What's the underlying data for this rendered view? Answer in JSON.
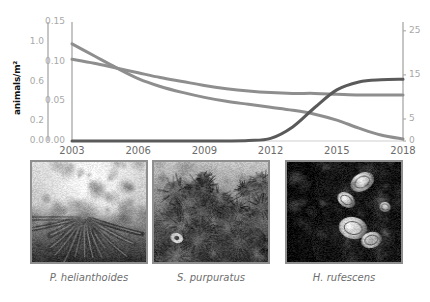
{
  "figure": {
    "background": "#ffffff",
    "panel_a_name": "population-trend-chart",
    "panel_b_name": "species-photo-row"
  },
  "chart_data": {
    "type": "line",
    "title": "",
    "xlabel": "",
    "ylabel": "animals/m²",
    "grid": false,
    "legend": "none",
    "x": [
      2003,
      2004,
      2005,
      2006,
      2007,
      2008,
      2009,
      2010,
      2011,
      2012,
      2013,
      2014,
      2015,
      2016,
      2017,
      2018
    ],
    "xlim": [
      2003,
      2018
    ],
    "xticks": [
      "2003",
      "2006",
      "2009",
      "2012",
      "2015",
      "2018"
    ],
    "axes": [
      {
        "id": "axis-left-outer",
        "position": "left-outer",
        "color": "#a8a8a8",
        "ticks": [
          "1.0",
          "0.6",
          "0.2",
          "0.0"
        ],
        "tick_values": [
          1.0,
          0.6,
          0.2,
          0.0
        ],
        "lim": [
          0.0,
          1.2
        ],
        "belongs_to": "H. rufescens"
      },
      {
        "id": "axis-left-inner",
        "position": "left-inner",
        "color": "#a8a8a8",
        "ticks": [
          "0.15",
          "0.10",
          "0.05",
          "0.00"
        ],
        "tick_values": [
          0.15,
          0.1,
          0.05,
          0.0
        ],
        "lim": [
          0.0,
          0.15
        ],
        "belongs_to": "P. helianthoides"
      },
      {
        "id": "axis-right",
        "position": "right",
        "color": "#a8a8a8",
        "ticks": [
          "25",
          "15",
          "5",
          "0"
        ],
        "tick_values": [
          25,
          15,
          5,
          0
        ],
        "lim": [
          0,
          27
        ],
        "belongs_to": "S. purpuratus"
      }
    ],
    "series": [
      {
        "name": "P. helianthoides",
        "axis": "axis-left-inner",
        "color": "#8e8e8e",
        "width": 3,
        "values": [
          0.103,
          0.098,
          0.092,
          0.086,
          0.08,
          0.075,
          0.07,
          0.066,
          0.063,
          0.061,
          0.06,
          0.06,
          0.059,
          0.058,
          0.058,
          0.058
        ]
      },
      {
        "name": "S. purpuratus",
        "axis": "axis-right",
        "color": "#8e8e8e",
        "width": 3,
        "values": [
          0.0,
          0.0,
          0.0,
          0.0,
          0.0,
          0.0,
          0.0,
          0.0,
          0.1,
          0.6,
          3.2,
          7.6,
          11.6,
          13.4,
          13.9,
          14.0
        ]
      },
      {
        "name": "H. rufescens",
        "axis": "axis-left-outer",
        "color": "#8e8e8e",
        "width": 3,
        "values": [
          0.98,
          0.86,
          0.74,
          0.63,
          0.55,
          0.49,
          0.44,
          0.4,
          0.37,
          0.34,
          0.31,
          0.27,
          0.21,
          0.13,
          0.06,
          0.02
        ]
      }
    ],
    "notes": [
      "Three lines share one plot with three separate y-axes.",
      "A rising dark line (S. purpuratus, right axis) crosses the two declining lines near 2015.",
      "P. helianthoides declines from 0.10 and flattens near 0.06.",
      "H. rufescens declines steadily toward 0 by 2018."
    ]
  },
  "photos": [
    {
      "name": "photo-p-helianthoides",
      "caption": "P. helianthoides",
      "alt": "sunflower sea star on seafloor",
      "border_color": "#8e8e8e",
      "seed": 11,
      "style": "bright-center"
    },
    {
      "name": "photo-s-purpuratus",
      "caption": "S. purpuratus",
      "alt": "dense bed of purple sea urchins",
      "border_color": "#8e8e8e",
      "seed": 27,
      "style": "urchin-bed"
    },
    {
      "name": "photo-h-rufescens",
      "caption": "H. rufescens",
      "alt": "red abalone on dark rock",
      "border_color": "#8e8e8e",
      "seed": 43,
      "style": "high-contrast"
    }
  ]
}
